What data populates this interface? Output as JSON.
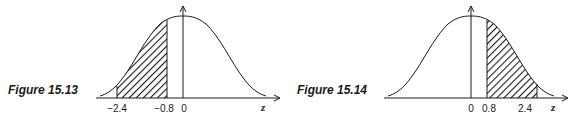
{
  "figures": [
    {
      "caption": "Figure 15.13",
      "axis_variable": "z",
      "ticks": [
        "−2.4",
        "−0.8",
        "0"
      ],
      "shaded_region": {
        "from": "-2.4",
        "to": "-0.8"
      }
    },
    {
      "caption": "Figure 15.14",
      "axis_variable": "z",
      "ticks": [
        "0",
        "0.8",
        "2.4"
      ],
      "shaded_region": {
        "from": "0.8",
        "to": "2.4"
      }
    }
  ],
  "colors": {
    "ink": "#1a1a1a",
    "background": "#ffffff"
  }
}
